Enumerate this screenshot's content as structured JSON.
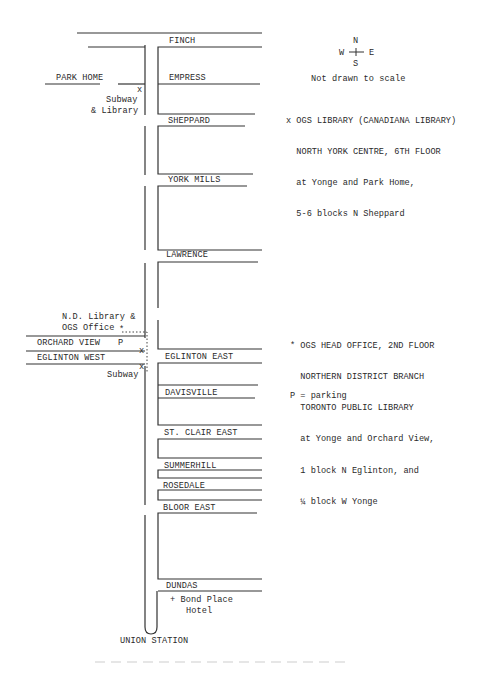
{
  "map": {
    "title": "Toronto Yonge Street Map - OGS Library Locations",
    "compass": {
      "n": "N",
      "s": "S",
      "e": "E",
      "w": "W"
    },
    "scale_note": "Not drawn to scale",
    "streets_east": [
      {
        "name": "FINCH"
      },
      {
        "name": "EMPRESS"
      },
      {
        "name": "SHEPPARD"
      },
      {
        "name": "YORK MILLS"
      },
      {
        "name": "LAWRENCE"
      },
      {
        "name": "EGLINTON EAST"
      },
      {
        "name": "DAVISVILLE"
      },
      {
        "name": "ST. CLAIR EAST"
      },
      {
        "name": "SUMMERHILL"
      },
      {
        "name": "ROSEDALE"
      },
      {
        "name": "BLOOR EAST"
      },
      {
        "name": "DUNDAS"
      }
    ],
    "streets_west": [
      {
        "name": "PARK HOME"
      },
      {
        "name": "ORCHARD VIEW"
      },
      {
        "name": "EGLINTON WEST"
      }
    ],
    "markers": {
      "subway_library": {
        "symbol": "x",
        "line1": "Subway",
        "line2": "& Library"
      },
      "nd_library": {
        "symbol": "*",
        "line1": "N.D. Library &",
        "line2": "OGS Office"
      },
      "parking": {
        "symbol": "P"
      },
      "eglinton_x": {
        "symbol": "x"
      },
      "subway_eglinton": {
        "symbol": "x",
        "label": "Subway"
      },
      "bond_place": {
        "line1": "+ Bond Place",
        "line2": "Hotel"
      },
      "union_station": {
        "label": "UNION STATION"
      }
    },
    "legend": {
      "x_note": {
        "line1": "x OGS LIBRARY (CANADIANA LIBRARY)",
        "line2": "  NORTH YORK CENTRE, 6TH FLOOR",
        "line3": "  at Yonge and Park Home,",
        "line4": "  5-6 blocks N Sheppard"
      },
      "star_note": {
        "line1": "* OGS HEAD OFFICE, 2ND FLOOR",
        "line2": "  NORTHERN DISTRICT BRANCH",
        "line3": "  TORONTO PUBLIC LIBRARY",
        "line4": "  at Yonge and Orchard View,",
        "line5": "  1 block N Eglinton, and",
        "line6": "  ¼ block W Yonge"
      },
      "parking_note": "P = parking"
    }
  }
}
